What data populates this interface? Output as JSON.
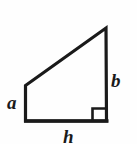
{
  "figure": {
    "type": "geometry-diagram",
    "shape_name": "right-trapezoid",
    "background_color": "#fefefe",
    "stroke_color": "#1a1a1a",
    "stroke_width": 3,
    "vertices": {
      "bottom_left": [
        25,
        122
      ],
      "bottom_right": [
        108,
        122
      ],
      "top_right": [
        106,
        27
      ],
      "upper_left": [
        25,
        85
      ]
    },
    "outline_path": "M 25 122 L 25 85 L 106 27 L 107 122 Z",
    "right_angle_marker": {
      "name": "right-angle-square",
      "x": 92,
      "y": 108,
      "width": 15,
      "height": 14,
      "corner": "bottom-right"
    }
  },
  "labels": {
    "left_side": {
      "text": "a",
      "name": "label-a",
      "edge": "left-vertical-side"
    },
    "right_side": {
      "text": "b",
      "name": "label-b",
      "edge": "right-vertical-side"
    },
    "bottom_side": {
      "text": "h",
      "name": "label-h",
      "edge": "bottom-horizontal-side"
    }
  }
}
